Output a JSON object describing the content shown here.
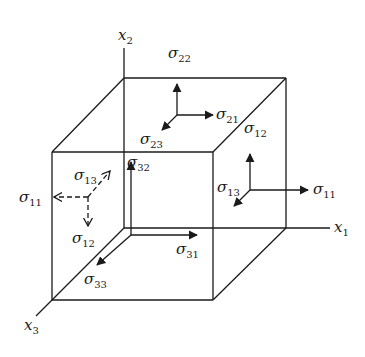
{
  "diagram": {
    "axes": {
      "x1": {
        "symbol": "x",
        "sub": "1"
      },
      "x2": {
        "symbol": "x",
        "sub": "2"
      },
      "x3": {
        "symbol": "x",
        "sub": "3"
      }
    },
    "top_face": {
      "normal": {
        "symbol": "σ",
        "sub": "22"
      },
      "shear_1": {
        "symbol": "σ",
        "sub": "21"
      },
      "shear_3": {
        "symbol": "σ",
        "sub": "23"
      }
    },
    "right_face": {
      "normal": {
        "symbol": "σ",
        "sub": "11"
      },
      "shear_2": {
        "symbol": "σ",
        "sub": "12"
      },
      "shear_3": {
        "symbol": "σ",
        "sub": "13"
      }
    },
    "hidden_left_face": {
      "style": "dashed",
      "normal": {
        "symbol": "σ",
        "sub": "11"
      },
      "shear_2": {
        "symbol": "σ",
        "sub": "12"
      },
      "shear_3": {
        "symbol": "σ",
        "sub": "13"
      }
    },
    "hidden_back_face": {
      "normal": {
        "symbol": "σ",
        "sub": "33"
      },
      "shear_1": {
        "symbol": "σ",
        "sub": "31"
      },
      "shear_2": {
        "symbol": "σ",
        "sub": "32"
      }
    },
    "colors": {
      "line": "#1a1a1a",
      "background": "#ffffff"
    }
  }
}
